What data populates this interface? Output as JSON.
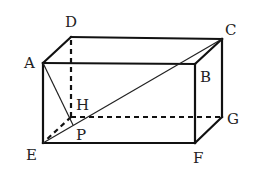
{
  "diagram": {
    "type": "rectangular-prism",
    "vertices": {
      "A": {
        "label": "A",
        "x": 43,
        "y": 63,
        "lx": 24,
        "ly": 68
      },
      "B": {
        "label": "B",
        "x": 195,
        "y": 64,
        "lx": 200,
        "ly": 82
      },
      "C": {
        "label": "C",
        "x": 222,
        "y": 39,
        "lx": 225,
        "ly": 35
      },
      "D": {
        "label": "D",
        "x": 71,
        "y": 37,
        "lx": 65,
        "ly": 27
      },
      "E": {
        "label": "E",
        "x": 43,
        "y": 143,
        "lx": 26,
        "ly": 160
      },
      "F": {
        "label": "F",
        "x": 195,
        "y": 143,
        "lx": 193,
        "ly": 163
      },
      "G": {
        "label": "G",
        "x": 222,
        "y": 117,
        "lx": 227,
        "ly": 124
      },
      "H": {
        "label": "H",
        "x": 71,
        "y": 117,
        "lx": 76,
        "ly": 110
      },
      "P": {
        "label": "P",
        "x": 73,
        "y": 125,
        "lx": 76,
        "ly": 140
      }
    },
    "solid_edges": [
      "A-B",
      "B-C",
      "C-D",
      "D-A",
      "A-E",
      "B-F",
      "C-G",
      "E-F",
      "F-G"
    ],
    "hidden_edges": [
      "D-H",
      "H-G",
      "H-E"
    ],
    "thin_segments": [
      "E-C",
      "A-P"
    ]
  }
}
